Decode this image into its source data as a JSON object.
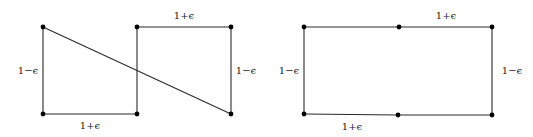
{
  "figures": [
    {
      "name": "left-figure",
      "vertices": [
        {
          "id": "a",
          "x": 43,
          "y": 27
        },
        {
          "id": "b",
          "x": 137,
          "y": 27
        },
        {
          "id": "c",
          "x": 231,
          "y": 27
        },
        {
          "id": "d",
          "x": 43,
          "y": 114
        },
        {
          "id": "e",
          "x": 137,
          "y": 114
        },
        {
          "id": "f",
          "x": 231,
          "y": 114
        }
      ],
      "edges": [
        {
          "from": "a",
          "to": "d"
        },
        {
          "from": "d",
          "to": "e"
        },
        {
          "from": "b",
          "to": "e"
        },
        {
          "from": "b",
          "to": "c"
        },
        {
          "from": "c",
          "to": "f"
        },
        {
          "from": "a",
          "to": "f"
        }
      ],
      "labels": {
        "top": "1+ϵ",
        "left": "1−ϵ",
        "right": "1−ϵ",
        "bottom": "1+ϵ"
      }
    },
    {
      "name": "right-figure",
      "vertices": [
        {
          "id": "a",
          "x": 304,
          "y": 27
        },
        {
          "id": "b",
          "x": 399,
          "y": 27
        },
        {
          "id": "c",
          "x": 492,
          "y": 27
        },
        {
          "id": "d",
          "x": 304,
          "y": 114
        },
        {
          "id": "e",
          "x": 398,
          "y": 115
        },
        {
          "id": "f",
          "x": 492,
          "y": 115
        }
      ],
      "edges": [
        {
          "from": "a",
          "to": "b"
        },
        {
          "from": "b",
          "to": "c"
        },
        {
          "from": "c",
          "to": "f"
        },
        {
          "from": "f",
          "to": "e"
        },
        {
          "from": "e",
          "to": "d"
        },
        {
          "from": "d",
          "to": "a"
        }
      ],
      "labels": {
        "top": "1+ϵ",
        "left": "1−ϵ",
        "right": "1−ϵ",
        "bottom": "1+ϵ"
      }
    }
  ]
}
